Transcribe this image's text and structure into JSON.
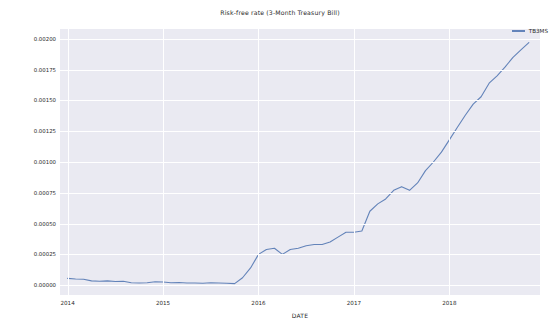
{
  "chart_data": {
    "type": "line",
    "title": "Risk-free rate (3-Month Treasury Bill)",
    "xlabel": "DATE",
    "ylabel": "",
    "grid": true,
    "legend_position": "upper right",
    "xticks": [
      "2014",
      "2015",
      "2016",
      "2017",
      "2018"
    ],
    "xtick_values": [
      2014,
      2015,
      2016,
      2017,
      2018
    ],
    "xlim": [
      2013.92,
      2018.95
    ],
    "yticks": [
      "0.00000",
      "0.00025",
      "0.00050",
      "0.00075",
      "0.00100",
      "0.00125",
      "0.00150",
      "0.00175",
      "0.00200"
    ],
    "ytick_values": [
      0.0,
      0.00025,
      0.0005,
      0.00075,
      0.001,
      0.00125,
      0.0015,
      0.00175,
      0.002
    ],
    "ylim": [
      -8e-05,
      0.00208
    ],
    "series": [
      {
        "name": "TB3MS",
        "color": "#4c72b0",
        "x": [
          2014.0,
          2014.083,
          2014.167,
          2014.25,
          2014.333,
          2014.417,
          2014.5,
          2014.583,
          2014.667,
          2014.75,
          2014.833,
          2014.917,
          2015.0,
          2015.083,
          2015.167,
          2015.25,
          2015.333,
          2015.417,
          2015.5,
          2015.583,
          2015.667,
          2015.75,
          2015.833,
          2015.917,
          2016.0,
          2016.083,
          2016.167,
          2016.25,
          2016.333,
          2016.417,
          2016.5,
          2016.583,
          2016.667,
          2016.75,
          2016.833,
          2016.917,
          2017.0,
          2017.083,
          2017.167,
          2017.25,
          2017.333,
          2017.417,
          2017.5,
          2017.583,
          2017.667,
          2017.75,
          2017.833,
          2017.917,
          2018.0,
          2018.083,
          2018.167,
          2018.25,
          2018.333,
          2018.417,
          2018.5,
          2018.583,
          2018.667,
          2018.75,
          2018.833
        ],
        "values": [
          5.5e-05,
          5e-05,
          4.8e-05,
          3.5e-05,
          3.2e-05,
          3.5e-05,
          3e-05,
          3.2e-05,
          2e-05,
          1.8e-05,
          2e-05,
          2.8e-05,
          2.6e-05,
          2e-05,
          2.2e-05,
          1.8e-05,
          1.8e-05,
          1.6e-05,
          2e-05,
          1.8e-05,
          1.6e-05,
          1.2e-05,
          6e-05,
          0.00014,
          0.00025,
          0.00029,
          0.0003,
          0.00025,
          0.00029,
          0.0003,
          0.00032,
          0.00033,
          0.00033,
          0.00035,
          0.00039,
          0.00043,
          0.00043,
          0.00044,
          0.0006,
          0.00066,
          0.0007,
          0.00077,
          0.0008,
          0.00077,
          0.00083,
          0.00093,
          0.001,
          0.00108,
          0.00118,
          0.00128,
          0.00138,
          0.00147,
          0.00153,
          0.00164,
          0.0017,
          0.00177,
          0.00185,
          0.00191,
          0.00197
        ]
      }
    ]
  },
  "legend": {
    "entries": [
      {
        "label": "TB3MS"
      }
    ]
  }
}
